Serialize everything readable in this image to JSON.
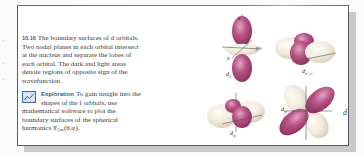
{
  "figure": {
    "number": "10.16",
    "caption": "The boundary surfaces of d orbitals. Two nodal planes in each orbital intersect at the nucleus and separate the lobes of each orbital. The dark and light areas denote regions of opposite sign of the wavefunction.",
    "caption_lines": [
      "The boundary surfaces of d orbitals.",
      "Two nodal planes in each orbital intersect",
      "at the nucleus and separate the lobes of",
      "each orbital. The dark and light areas",
      "denote regions of opposite sign of the",
      "wavefunction."
    ],
    "exploration": {
      "icon": "chart-icon",
      "label": "Exploration",
      "lines": [
        "To gain insight into the",
        "shapes of the f orbitals, use",
        "mathematical software to plot the",
        "boundary surfaces of the spherical",
        "harmonics"
      ],
      "symbol": "Y",
      "symbol_subscript": "3,mₗ",
      "symbol_args": "(θ,φ)."
    },
    "orbitals": [
      {
        "name": "dz2",
        "label": "d",
        "subscript": "z²"
      },
      {
        "name": "dx2-y2",
        "label": "d",
        "subscript": "x²−y²"
      },
      {
        "name": "dxy",
        "label": "d",
        "subscript": "xy"
      },
      {
        "name": "dyz",
        "label": "d",
        "subscript": "yz"
      },
      {
        "name": "dzx",
        "label": "d",
        "subscript": "zx"
      }
    ],
    "axes": {
      "x": "x",
      "y": "y",
      "z": "z"
    },
    "colors": {
      "dark_lobe": "#a4406e",
      "light_lobe": "#efe6d6",
      "frame": "#5a5a5e",
      "accent": "#2a5fa0"
    }
  }
}
